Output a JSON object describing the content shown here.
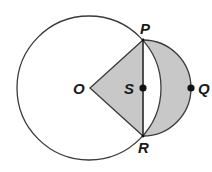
{
  "diagram": {
    "type": "geometry-circles",
    "colors": {
      "stroke": "#3a3a3a",
      "shade": "#c8c8c8",
      "background": "#ffffff",
      "point": "#111111"
    },
    "big_circle": {
      "center_label": "O",
      "cx": 89,
      "cy": 88,
      "r": 72
    },
    "semicircle": {
      "center_label": "S",
      "cx": 143,
      "cy": 88,
      "r": 48
    },
    "points": [
      {
        "label": "P",
        "x": 143,
        "y": 40
      },
      {
        "label": "R",
        "x": 143,
        "y": 136
      },
      {
        "label": "S",
        "x": 143,
        "y": 88
      },
      {
        "label": "Q",
        "x": 191,
        "y": 88
      },
      {
        "label": "O",
        "x": 90,
        "y": 88
      }
    ],
    "labels": {
      "O": "O",
      "P": "P",
      "Q": "Q",
      "R": "R",
      "S": "S"
    },
    "shaded_regions": [
      "triangle OPR",
      "crescent between arc PR of circle O and semicircle PQR"
    ]
  }
}
